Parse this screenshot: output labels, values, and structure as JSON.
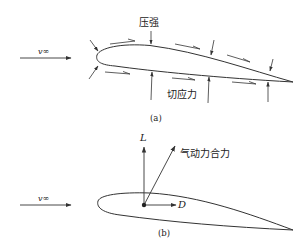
{
  "panel_a": {
    "freestream_label": "v∞",
    "pressure_label": "压强",
    "shear_label": "切应力",
    "caption": "(a)"
  },
  "panel_b": {
    "freestream_label": "v∞",
    "lift_label": "L",
    "drag_label": "D",
    "resultant_label": "气动力合力",
    "caption": "(b)"
  },
  "colors": {
    "stroke": "#333333",
    "background": "#ffffff"
  }
}
